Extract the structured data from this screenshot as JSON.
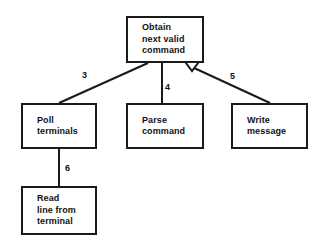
{
  "diagram": {
    "type": "structure-chart",
    "background_color": "#ffffff",
    "line_color": "#1a1a1a",
    "text_color": "#111111",
    "nodes": [
      {
        "id": "obtain",
        "lines": [
          "Obtain",
          "next valid",
          "command"
        ],
        "x": 126,
        "y": 16,
        "w": 78,
        "h": 47,
        "has_aggregation_diamond": true
      },
      {
        "id": "poll",
        "lines": [
          "Poll",
          "terminals"
        ],
        "x": 21,
        "y": 103,
        "w": 76,
        "h": 46,
        "has_aggregation_diamond": false
      },
      {
        "id": "parse",
        "lines": [
          "Parse",
          "command"
        ],
        "x": 126,
        "y": 103,
        "w": 78,
        "h": 46,
        "has_aggregation_diamond": false
      },
      {
        "id": "write",
        "lines": [
          "Write",
          "message"
        ],
        "x": 231,
        "y": 103,
        "w": 77,
        "h": 46,
        "has_aggregation_diamond": false
      },
      {
        "id": "read",
        "lines": [
          "Read",
          "line from",
          "terminal"
        ],
        "x": 21,
        "y": 186,
        "w": 76,
        "h": 49,
        "has_aggregation_diamond": false
      }
    ],
    "edges": [
      {
        "id": "obtain-poll",
        "from": "obtain",
        "to": "poll",
        "label": "3",
        "label_x": 82,
        "label_y": 70
      },
      {
        "id": "obtain-parse",
        "from": "obtain",
        "to": "parse",
        "label": "4",
        "label_x": 165,
        "label_y": 82
      },
      {
        "id": "obtain-write",
        "from": "obtain",
        "to": "write",
        "label": "5",
        "label_x": 230,
        "label_y": 71
      },
      {
        "id": "poll-read",
        "from": "poll",
        "to": "read",
        "label": "6",
        "label_x": 65,
        "label_y": 163
      }
    ]
  }
}
